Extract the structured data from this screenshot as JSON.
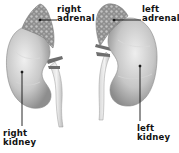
{
  "diagram": {
    "labels": {
      "right_adrenal": [
        "right",
        "adrenal"
      ],
      "left_adrenal": [
        "left",
        "adrenal"
      ],
      "right_kidney": [
        "right",
        "kidney"
      ],
      "left_kidney": [
        "left",
        "kidney"
      ]
    },
    "colors": {
      "background": "#ffffff",
      "kidney_light": "#e8e8e8",
      "kidney_mid": "#b9b9b9",
      "kidney_dark": "#8a8a8a",
      "adrenal": "#9a9a9a",
      "label": "#111111",
      "leader_line": "#111111"
    }
  }
}
